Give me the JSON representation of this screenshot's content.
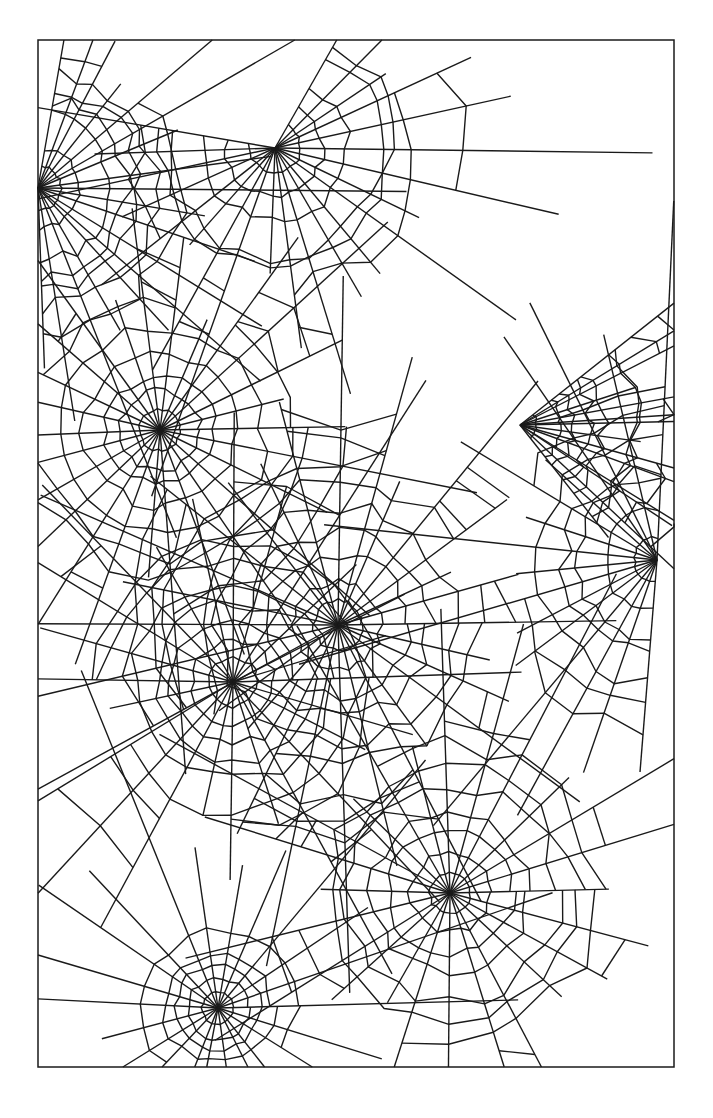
{
  "artwork": {
    "title": "Spider web line-art pattern",
    "stroke_color": "#1a1a1a",
    "background_color": "#ffffff",
    "frame": {
      "x": 38,
      "y": 40,
      "width": 636,
      "height": 1027
    },
    "hubs": [
      {
        "name": "web-hub-top-left",
        "x": 38,
        "y": 188,
        "spokes": 18,
        "rings": 7,
        "spacing": 22,
        "start": -80,
        "sweep": 170
      },
      {
        "name": "web-hub-top-center",
        "x": 275,
        "y": 148,
        "spokes": 22,
        "rings": 7,
        "spacing": 26,
        "start": -60,
        "sweep": 250
      },
      {
        "name": "web-hub-upper-left",
        "x": 160,
        "y": 430,
        "spokes": 26,
        "rings": 8,
        "spacing": 20,
        "start": 0,
        "sweep": 360
      },
      {
        "name": "web-hub-right",
        "x": 657,
        "y": 560,
        "spokes": 16,
        "rings": 7,
        "spacing": 24,
        "start": 95,
        "sweep": 175
      },
      {
        "name": "web-hub-center",
        "x": 338,
        "y": 625,
        "spokes": 28,
        "rings": 9,
        "spacing": 22,
        "start": 0,
        "sweep": 360
      },
      {
        "name": "web-hub-middle-left",
        "x": 233,
        "y": 682,
        "spokes": 24,
        "rings": 8,
        "spacing": 22,
        "start": 0,
        "sweep": 360
      },
      {
        "name": "web-hub-lower-right",
        "x": 450,
        "y": 893,
        "spokes": 24,
        "rings": 8,
        "spacing": 22,
        "start": 0,
        "sweep": 360
      },
      {
        "name": "web-hub-bottom-left",
        "x": 218,
        "y": 1008,
        "spokes": 22,
        "rings": 5,
        "spacing": 15,
        "start": 0,
        "sweep": 360
      },
      {
        "name": "web-hub-right-upper",
        "x": 520,
        "y": 425,
        "spokes": 14,
        "rings": 9,
        "spacing": 18,
        "start": -40,
        "sweep": 90
      }
    ]
  }
}
